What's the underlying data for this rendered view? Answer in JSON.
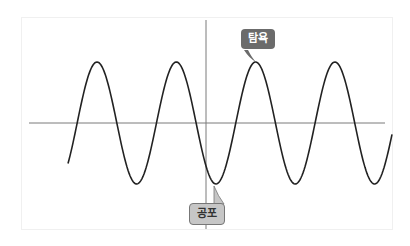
{
  "diagram": {
    "type": "sine-wave",
    "labels": {
      "greed": "탐욕",
      "fear": "공포"
    },
    "axis_color": "#7a7a7a",
    "curve_color": "#222222",
    "callout_dark": "#6b6b6b",
    "callout_light": "#c6c6c6"
  }
}
